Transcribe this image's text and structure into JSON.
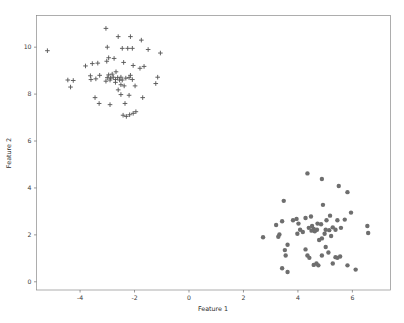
{
  "figure": {
    "background_color": "#ffffff",
    "width": 404,
    "height": 323
  },
  "chart_data": {
    "type": "scatter",
    "title": "",
    "xlabel": "Feature 1",
    "ylabel": "Feature 2",
    "xlim": [
      -5.6,
      7.4
    ],
    "ylim": [
      -0.35,
      11.35
    ],
    "xticks": [
      -4,
      -2,
      0,
      2,
      4,
      6
    ],
    "xticklabels": [
      "-4",
      "-2",
      "0",
      "2",
      "4",
      "6"
    ],
    "yticks": [
      0,
      2,
      4,
      6,
      8,
      10
    ],
    "yticklabels": [
      "0",
      "2",
      "4",
      "6",
      "8",
      "10"
    ],
    "grid": false,
    "legend": null,
    "marker_colors": {
      "cluster_cross": "#5a5a5a",
      "cluster_circle": "#6e6e6e",
      "spine": "#8a8a8a",
      "text": "#3a3a3a"
    },
    "series": [
      {
        "name": "cluster_cross",
        "marker": "plus",
        "color": "#5a5a5a",
        "count": 64,
        "points": [
          [
            -5.2,
            9.85
          ],
          [
            -3.05,
            10.8
          ],
          [
            -2.6,
            10.45
          ],
          [
            -2.15,
            10.45
          ],
          [
            -1.75,
            10.3
          ],
          [
            -3.0,
            10.0
          ],
          [
            -2.45,
            9.95
          ],
          [
            -2.25,
            9.95
          ],
          [
            -2.08,
            9.95
          ],
          [
            -1.5,
            9.9
          ],
          [
            -1.05,
            9.75
          ],
          [
            -2.95,
            9.55
          ],
          [
            -3.02,
            9.4
          ],
          [
            -2.4,
            9.35
          ],
          [
            -3.55,
            9.3
          ],
          [
            -3.8,
            9.2
          ],
          [
            -2.05,
            9.22
          ],
          [
            -1.65,
            9.18
          ],
          [
            -1.8,
            9.1
          ],
          [
            -4.45,
            8.6
          ],
          [
            -4.25,
            8.58
          ],
          [
            -3.0,
            8.7
          ],
          [
            -2.88,
            8.68
          ],
          [
            -2.78,
            8.72
          ],
          [
            -2.62,
            8.7
          ],
          [
            -2.5,
            8.72
          ],
          [
            -2.32,
            8.68
          ],
          [
            -2.2,
            8.7
          ],
          [
            -2.08,
            8.62
          ],
          [
            -1.15,
            8.72
          ],
          [
            -4.35,
            8.3
          ],
          [
            -3.05,
            8.55
          ],
          [
            -2.7,
            8.5
          ],
          [
            -2.5,
            8.4
          ],
          [
            -2.38,
            8.35
          ],
          [
            -1.98,
            8.35
          ],
          [
            -1.22,
            8.45
          ],
          [
            -2.6,
            8.18
          ],
          [
            -3.45,
            7.85
          ],
          [
            -2.2,
            7.95
          ],
          [
            -1.7,
            7.85
          ],
          [
            -3.3,
            7.6
          ],
          [
            -2.9,
            7.55
          ],
          [
            -2.35,
            7.6
          ],
          [
            -2.42,
            7.1
          ],
          [
            -2.3,
            7.05
          ],
          [
            -2.18,
            7.12
          ],
          [
            -2.05,
            7.18
          ],
          [
            -1.95,
            7.25
          ],
          [
            -3.35,
            9.32
          ],
          [
            -2.75,
            9.52
          ],
          [
            -3.6,
            8.62
          ],
          [
            -3.42,
            8.65
          ],
          [
            -2.95,
            8.82
          ],
          [
            -2.82,
            8.85
          ],
          [
            -2.55,
            8.6
          ],
          [
            -2.9,
            8.6
          ],
          [
            -2.7,
            8.62
          ],
          [
            -2.45,
            8.6
          ],
          [
            -3.62,
            8.78
          ],
          [
            -3.28,
            8.8
          ],
          [
            -2.15,
            8.8
          ],
          [
            -2.68,
            8.95
          ],
          [
            -2.5,
            7.98
          ]
        ]
      },
      {
        "name": "cluster_circle",
        "marker": "circle",
        "color": "#6e6e6e",
        "count": 63,
        "points": [
          [
            4.35,
            4.62
          ],
          [
            4.88,
            4.38
          ],
          [
            5.5,
            4.08
          ],
          [
            5.82,
            3.82
          ],
          [
            3.48,
            3.45
          ],
          [
            4.92,
            3.28
          ],
          [
            5.95,
            2.95
          ],
          [
            4.48,
            2.78
          ],
          [
            4.28,
            2.72
          ],
          [
            3.95,
            2.68
          ],
          [
            5.18,
            2.82
          ],
          [
            5.05,
            2.62
          ],
          [
            5.72,
            2.65
          ],
          [
            3.42,
            2.58
          ],
          [
            3.2,
            2.42
          ],
          [
            4.02,
            2.48
          ],
          [
            4.85,
            2.45
          ],
          [
            5.28,
            2.32
          ],
          [
            5.58,
            2.3
          ],
          [
            6.55,
            2.38
          ],
          [
            6.58,
            2.08
          ],
          [
            4.58,
            2.25
          ],
          [
            4.7,
            2.22
          ],
          [
            4.62,
            2.15
          ],
          [
            4.5,
            2.18
          ],
          [
            5.02,
            2.22
          ],
          [
            5.15,
            2.2
          ],
          [
            4.18,
            2.12
          ],
          [
            3.98,
            2.05
          ],
          [
            3.32,
            2.02
          ],
          [
            3.28,
            1.92
          ],
          [
            2.72,
            1.9
          ],
          [
            4.88,
            1.85
          ],
          [
            4.78,
            1.78
          ],
          [
            3.62,
            1.58
          ],
          [
            4.28,
            1.38
          ],
          [
            3.52,
            1.35
          ],
          [
            5.02,
            1.48
          ],
          [
            5.12,
            1.25
          ],
          [
            4.35,
            1.12
          ],
          [
            3.55,
            1.12
          ],
          [
            5.55,
            1.08
          ],
          [
            5.38,
            1.05
          ],
          [
            5.45,
            1.02
          ],
          [
            4.68,
            0.78
          ],
          [
            4.58,
            0.72
          ],
          [
            4.75,
            0.7
          ],
          [
            5.82,
            0.7
          ],
          [
            3.42,
            0.58
          ],
          [
            6.12,
            0.52
          ],
          [
            3.62,
            0.42
          ],
          [
            4.52,
            2.38
          ],
          [
            4.4,
            2.3
          ],
          [
            5.38,
            2.22
          ],
          [
            4.98,
            2.05
          ],
          [
            4.08,
            2.22
          ],
          [
            3.82,
            2.62
          ],
          [
            5.45,
            2.62
          ],
          [
            4.72,
            2.48
          ],
          [
            5.22,
            1.95
          ],
          [
            4.42,
            1.02
          ],
          [
            4.88,
            1.12
          ],
          [
            5.28,
            0.78
          ]
        ]
      }
    ]
  }
}
